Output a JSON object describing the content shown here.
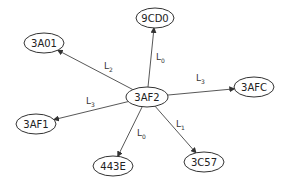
{
  "diagram": {
    "type": "directed-graph",
    "center": {
      "id": "3AF2",
      "label": "3AF2"
    },
    "nodes": [
      {
        "id": "3AF2",
        "label": "3AF2"
      },
      {
        "id": "9CD0",
        "label": "9CD0"
      },
      {
        "id": "3A01",
        "label": "3A01"
      },
      {
        "id": "3AFC",
        "label": "3AFC"
      },
      {
        "id": "3AF1",
        "label": "3AF1"
      },
      {
        "id": "443E",
        "label": "443E"
      },
      {
        "id": "3C57",
        "label": "3C57"
      }
    ],
    "edges": [
      {
        "from": "3AF2",
        "to": "9CD0",
        "label": "L",
        "sub": "0"
      },
      {
        "from": "3AF2",
        "to": "3A01",
        "label": "L",
        "sub": "2"
      },
      {
        "from": "3AF2",
        "to": "3AFC",
        "label": "L",
        "sub": "3"
      },
      {
        "from": "3AF2",
        "to": "3AF1",
        "label": "L",
        "sub": "3"
      },
      {
        "from": "3AF2",
        "to": "443E",
        "label": "L",
        "sub": "0"
      },
      {
        "from": "3AF2",
        "to": "3C57",
        "label": "L",
        "sub": "1"
      }
    ]
  }
}
